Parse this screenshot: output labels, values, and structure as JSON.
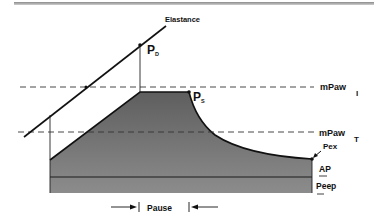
{
  "figure": {
    "labels": {
      "elastance": "Elastance",
      "pd_main": "P",
      "pd_sub": "D",
      "ps_main": "P",
      "ps_sub": "S",
      "mpaw_i_main": "mPaw",
      "mpaw_i_sub": "I",
      "mpaw_t_main": "mPaw",
      "mpaw_t_sub": "T",
      "pex": "Pex",
      "ap": "AP",
      "peep": "Peep",
      "pause": "Pause"
    },
    "colors": {
      "line": "#111111",
      "shade_top": "#6e6e6e",
      "shade_bottom": "#8a8a8a",
      "dash": "#333333"
    }
  }
}
